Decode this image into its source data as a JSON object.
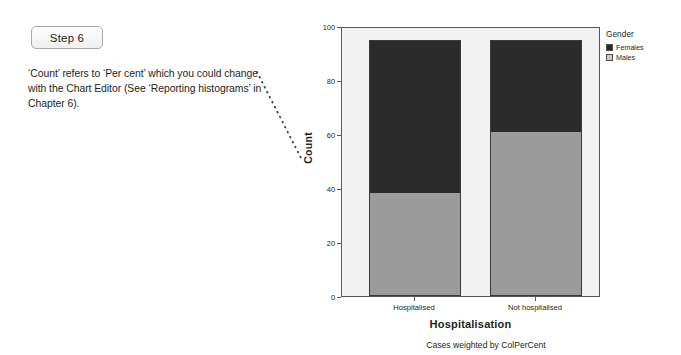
{
  "annotation": {
    "badge_label": "Step 6",
    "note_text": "‘Count’ refers to ‘Per cent’ which you could change with the Chart Editor (See ‘Reporting histograms’ in Chapter 6)."
  },
  "chart_data": {
    "type": "bar",
    "stacked": true,
    "stacked_mode": "percent",
    "title": "",
    "xlabel": "Hospitalisation",
    "ylabel": "Count",
    "footnote": "Cases weighted by ColPerCent",
    "categories": [
      "Hospitalised",
      "Not hospitalised"
    ],
    "ylim": [
      0,
      100
    ],
    "yticks": [
      "0",
      "20",
      "40",
      "60",
      "80",
      "100"
    ],
    "ytick_values": [
      0,
      20,
      40,
      60,
      80,
      100
    ],
    "grid": false,
    "legend": {
      "title": "Gender",
      "position": "right",
      "entries": [
        {
          "label": "Females",
          "color": "#2b2b2b"
        },
        {
          "label": "Males",
          "color": "#9b9b9b"
        }
      ]
    },
    "series": [
      {
        "name": "Females",
        "color": "#2b2b2b",
        "values": [
          60,
          36
        ]
      },
      {
        "name": "Males",
        "color": "#9b9b9b",
        "values": [
          40,
          64
        ]
      }
    ],
    "bar_totals": [
      100,
      100
    ]
  },
  "colors": {
    "females": "#2b2b2b",
    "males": "#9b9b9b",
    "axis": "#58595b",
    "plot_background": "#f2f2f2",
    "text": "#231f20"
  }
}
